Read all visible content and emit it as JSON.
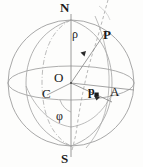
{
  "figure": {
    "background_color": "#fdfdfc",
    "line_color": "#9a9a9a",
    "dash_color": "#a8a8a8",
    "label_color": "#1a1a1a",
    "width": 143,
    "height": 167
  },
  "labels": {
    "north_pole": "N",
    "south_pole": "S",
    "center": "O",
    "point_c": "C",
    "point_a": "A",
    "point_p_bold": "P",
    "projection_p": "p",
    "radius_rho": "ρ",
    "angle_phi": "φ"
  },
  "geometry": {
    "sphere": {
      "cx": 71,
      "cy": 83,
      "r": 63
    },
    "equator": {
      "cx": 71,
      "cy": 83,
      "rx": 63,
      "ry": 17
    },
    "polar_axis": {
      "x": 71,
      "y_top": 14,
      "y_bottom": 157
    },
    "arrows": [
      {
        "name": "rho-arrow",
        "from": [
          71,
          83
        ],
        "to": [
          86,
          52
        ]
      },
      {
        "name": "p-arrow",
        "from": [
          71,
          83
        ],
        "to": [
          99,
          96
        ]
      }
    ],
    "marker_point": {
      "name": "point-marker",
      "x": 97,
      "y": 95
    }
  }
}
